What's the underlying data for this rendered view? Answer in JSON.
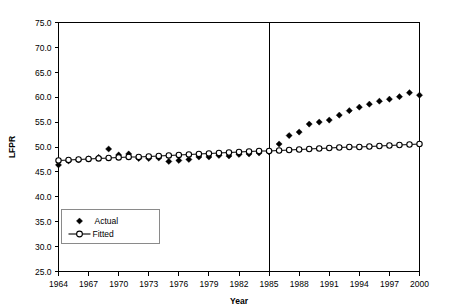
{
  "chart_data": {
    "type": "line",
    "title": "",
    "xlabel": "Year",
    "ylabel": "LFPR",
    "xlim": [
      1964,
      2000
    ],
    "ylim": [
      25.0,
      75.0
    ],
    "grid": false,
    "legend_position": "inside-bottom-left",
    "y_ticks": [
      "25.0",
      "30.0",
      "35.0",
      "40.0",
      "45.0",
      "50.0",
      "55.0",
      "60.0",
      "65.0",
      "70.0",
      "75.0"
    ],
    "y_tick_values": [
      25.0,
      30.0,
      35.0,
      40.0,
      45.0,
      50.0,
      55.0,
      60.0,
      65.0,
      70.0,
      75.0
    ],
    "x_ticks": [
      "1964",
      "1967",
      "1970",
      "1973",
      "1976",
      "1979",
      "1982",
      "1985",
      "1988",
      "1991",
      "1994",
      "1997",
      "2000"
    ],
    "x_tick_values": [
      1964,
      1967,
      1970,
      1973,
      1976,
      1979,
      1982,
      1985,
      1988,
      1991,
      1994,
      1997,
      2000
    ],
    "annotations": [
      {
        "type": "vertical-line",
        "x": 1985,
        "label": ""
      }
    ],
    "x": [
      1964,
      1965,
      1966,
      1967,
      1968,
      1969,
      1970,
      1971,
      1972,
      1973,
      1974,
      1975,
      1976,
      1977,
      1978,
      1979,
      1980,
      1981,
      1982,
      1983,
      1984,
      1985,
      1986,
      1987,
      1988,
      1989,
      1990,
      1991,
      1992,
      1993,
      1994,
      1995,
      1996,
      1997,
      1998,
      1999,
      2000
    ],
    "series": [
      {
        "name": "Actual",
        "marker": "filled-diamond",
        "line": false,
        "values": [
          46.4,
          47.2,
          47.4,
          47.6,
          47.9,
          49.6,
          48.4,
          48.6,
          47.7,
          47.7,
          47.8,
          47.1,
          47.3,
          47.5,
          48.0,
          48.0,
          48.3,
          48.2,
          48.5,
          48.6,
          48.8,
          49.0,
          50.6,
          52.3,
          53.0,
          54.6,
          55.0,
          55.4,
          56.4,
          57.3,
          58.0,
          58.6,
          59.2,
          59.6,
          60.1,
          60.9,
          60.4
        ]
      },
      {
        "name": "Fitted",
        "marker": "open-circle",
        "line": true,
        "values": [
          47.3,
          47.4,
          47.5,
          47.6,
          47.7,
          47.8,
          47.9,
          48.0,
          48.0,
          48.1,
          48.2,
          48.3,
          48.4,
          48.5,
          48.6,
          48.7,
          48.8,
          48.9,
          49.0,
          49.1,
          49.2,
          49.2,
          49.3,
          49.4,
          49.5,
          49.6,
          49.7,
          49.8,
          49.9,
          50.0,
          50.0,
          50.1,
          50.2,
          50.3,
          50.4,
          50.5,
          50.6
        ]
      }
    ],
    "colors": {
      "actual": "#000000",
      "fitted": "#000000",
      "axis": "#000000",
      "background": "#ffffff"
    }
  }
}
